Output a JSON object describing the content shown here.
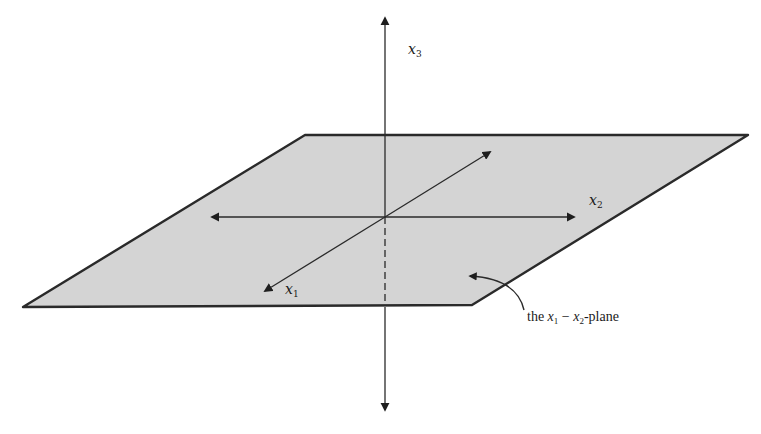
{
  "figure": {
    "type": "3d-coordinate-axes-with-plane",
    "axes": {
      "x1": {
        "label": "x",
        "subscript": "1"
      },
      "x2": {
        "label": "x",
        "subscript": "2"
      },
      "x3": {
        "label": "x",
        "subscript": "3"
      }
    },
    "plane": {
      "fill": "#d4d4d4",
      "edge": "#2a2a2a"
    },
    "annotation": {
      "prefix": "the ",
      "var1": "x",
      "sub1": "1",
      "dash": " − ",
      "var2": "x",
      "sub2": "2",
      "suffix": "-plane"
    },
    "colors": {
      "axis": "#2a2a2a",
      "background": "#ffffff"
    }
  }
}
